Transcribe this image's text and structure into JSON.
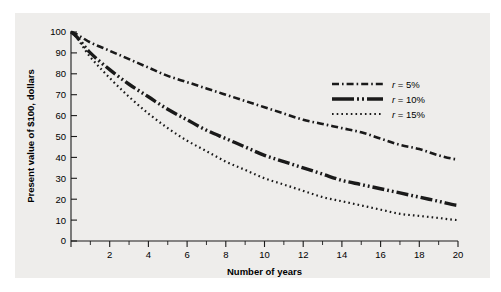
{
  "chart_data": {
    "type": "line",
    "title": "",
    "xlabel": "Number of years",
    "ylabel": "Present value of $100, dollars",
    "xlim": [
      0,
      20
    ],
    "ylim": [
      0,
      100
    ],
    "grid": false,
    "legend_position": "upper-right-inside",
    "x_ticks_major": [
      0,
      2,
      4,
      6,
      8,
      10,
      12,
      14,
      16,
      18,
      20
    ],
    "x_tick_labels": [
      "",
      "2",
      "4",
      "6",
      "8",
      "10",
      "12",
      "14",
      "16",
      "18",
      "20"
    ],
    "x_ticks_minor": [
      1,
      3,
      5,
      7,
      9,
      11,
      13,
      15,
      17,
      19
    ],
    "y_ticks_major": [
      0,
      10,
      20,
      30,
      40,
      50,
      60,
      70,
      80,
      90,
      100
    ],
    "y_tick_labels": [
      "0",
      "10",
      "20",
      "30",
      "40",
      "50",
      "60",
      "70",
      "80",
      "90",
      "100"
    ],
    "x": [
      0,
      1,
      2,
      3,
      4,
      5,
      6,
      7,
      8,
      9,
      10,
      11,
      12,
      13,
      14,
      15,
      16,
      17,
      18,
      19,
      20
    ],
    "series": [
      {
        "name": "r = 5%",
        "rate": 5,
        "dash": "dash-dot",
        "values": [
          100,
          95,
          91,
          87,
          83,
          79,
          76,
          73,
          70,
          67,
          64,
          61,
          58,
          56,
          54,
          52,
          49,
          46,
          44,
          41,
          39
        ]
      },
      {
        "name": "r = 10%",
        "rate": 10,
        "dash": "dash-dot-dot",
        "values": [
          100,
          90,
          82,
          75,
          69,
          63,
          58,
          53,
          49,
          45,
          41,
          38,
          35,
          32,
          29,
          27,
          25,
          23,
          21,
          19,
          17
        ]
      },
      {
        "name": "r = 15%",
        "rate": 15,
        "dash": "dotted",
        "values": [
          100,
          88,
          78,
          69,
          61,
          54,
          48,
          43,
          38,
          34,
          30,
          27,
          24,
          21,
          19,
          17,
          15,
          13,
          12,
          11,
          10
        ]
      }
    ]
  },
  "legend": {
    "entries": [
      {
        "label": "r = 5%",
        "label_var": "r",
        "label_rest": " = 5%"
      },
      {
        "label": "r = 10%",
        "label_var": "r",
        "label_rest": " = 10%"
      },
      {
        "label": "r = 15%",
        "label_var": "r",
        "label_rest": " = 15%"
      }
    ]
  },
  "colors": {
    "background": "#ffffff",
    "panel": "#eeedeb",
    "ink": "#1a1a1a"
  }
}
